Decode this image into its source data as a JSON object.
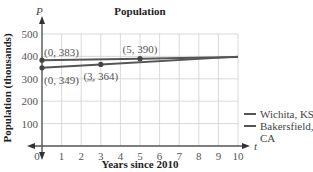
{
  "chart_data": {
    "type": "line",
    "title": "Population",
    "xlabel": "Years since 2010",
    "ylabel": "Population (thousands)",
    "x_axis_var": "t",
    "y_axis_var": "P",
    "xlim": [
      0,
      10
    ],
    "ylim": [
      0,
      500
    ],
    "x_ticks": [
      "0",
      "1",
      "2",
      "3",
      "4",
      "5",
      "6",
      "7",
      "8",
      "9",
      "10"
    ],
    "y_ticks": [
      "100",
      "200",
      "300",
      "400",
      "500"
    ],
    "grid": true,
    "legend_position": "right",
    "series": [
      {
        "name": "Wichita, KS",
        "color": "#555555",
        "points": [
          [
            0,
            383
          ],
          [
            5,
            390
          ],
          [
            10,
            397
          ]
        ]
      },
      {
        "name": "Bakersfield, CA",
        "color": "#555555",
        "points": [
          [
            0,
            349
          ],
          [
            3,
            364
          ],
          [
            10,
            399
          ]
        ]
      }
    ],
    "annotations": [
      {
        "label": "(0, 383)",
        "x": 0,
        "y": 383
      },
      {
        "label": "(5, 390)",
        "x": 5,
        "y": 390
      },
      {
        "label": "(0, 349)",
        "x": 0,
        "y": 349
      },
      {
        "label": "(3, 364)",
        "x": 3,
        "y": 364
      }
    ]
  },
  "legend": {
    "items": [
      {
        "label_line1": "Wichita, KS",
        "label_line2": ""
      },
      {
        "label_line1": "Bakersfield,",
        "label_line2": "CA"
      }
    ]
  }
}
